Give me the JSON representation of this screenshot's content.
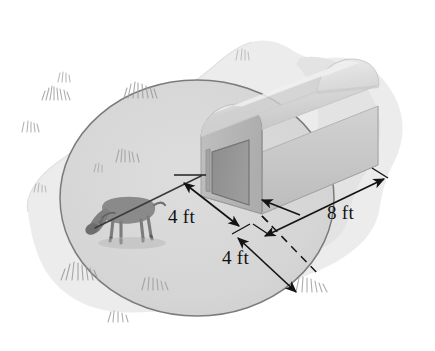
{
  "figure": {
    "type": "isometric-geometry-illustration",
    "background_color": "#ffffff"
  },
  "labels": {
    "barn_width": "4 ft",
    "tether_length": "4 ft",
    "barn_length": "8 ft"
  },
  "dimensions": {
    "barn_width_value": 4,
    "barn_width_unit": "ft",
    "tether_length_value": 4,
    "tether_length_unit": "ft",
    "barn_length_value": 8,
    "barn_length_unit": "ft"
  },
  "objects": {
    "barn": {
      "name": "barn",
      "roof_style": "curved gambrel",
      "door": "dark rectangular door on front face",
      "face_color": "#b7b7b7",
      "roof_color": "#dcdcdc",
      "side_color": "#c8c8c8",
      "door_color": "#8e8e8e"
    },
    "animal": {
      "name": "goat",
      "color": "#8a8a8a",
      "pose": "grazing, tethered by rope"
    },
    "rope": {
      "name": "tether-rope",
      "color": "#3a3a3a",
      "anchor": "near corner of barn"
    },
    "grazing_area": {
      "name": "grazing-circle",
      "shape": "circle",
      "fill_color": "#d7d7d7",
      "outline_color": "#7b7b7b"
    },
    "ground_patch": {
      "name": "ground-patch",
      "fill_color": "#ebebeb"
    },
    "shadow": {
      "name": "barn-shadow",
      "fill_color": "#e2e2e2"
    }
  },
  "colors": {
    "ink": "#111111",
    "line": "#1a1a1a",
    "grass": "#9a9a9a",
    "white": "#ffffff"
  }
}
